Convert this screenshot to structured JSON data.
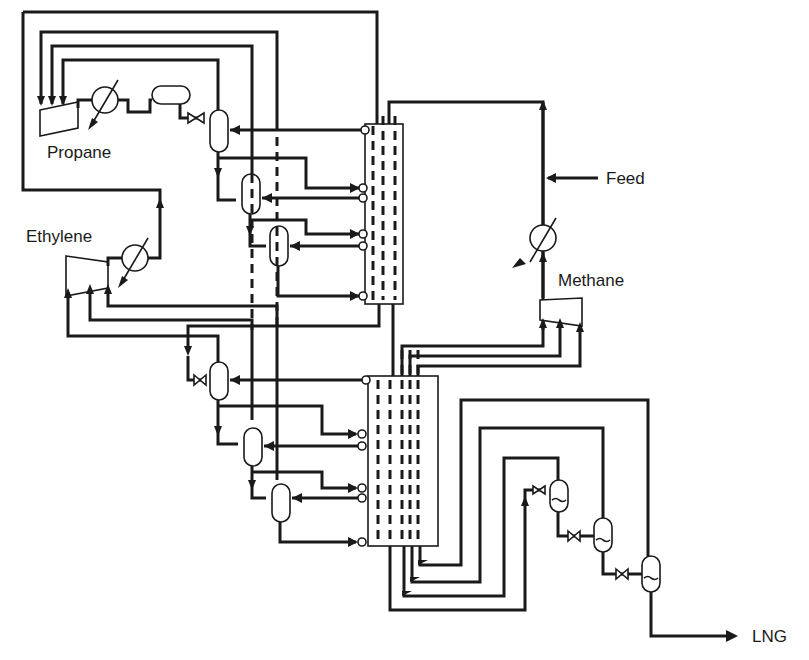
{
  "diagram": {
    "type": "process flow diagram",
    "labels": {
      "propane": "Propane",
      "ethylene": "Ethylene",
      "methane": "Methane",
      "feed": "Feed",
      "lng": "LNG"
    },
    "refrigerant_cycles": [
      {
        "name": "Propane",
        "compressor_stages": 3,
        "flash_drums": 3,
        "expansion_valves": 3
      },
      {
        "name": "Ethylene",
        "compressor_stages": 3,
        "flash_drums": 3,
        "expansion_valves": 3
      },
      {
        "name": "Methane",
        "compressor_stages": 3,
        "flash_drums": 3,
        "expansion_valves": 3
      }
    ],
    "heat_exchangers": [
      "upper cold box",
      "lower cold box"
    ],
    "streams": {
      "inlet": "Feed",
      "outlet": "LNG"
    }
  }
}
